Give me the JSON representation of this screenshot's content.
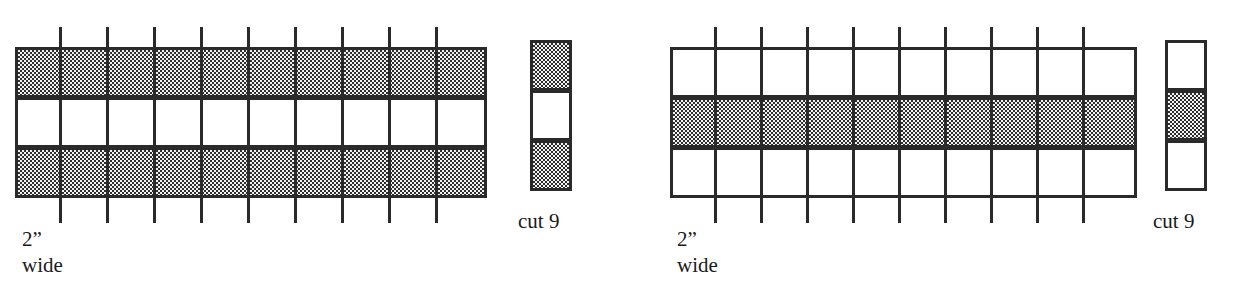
{
  "figure": {
    "kind": "quilting-strip-set-diagram",
    "ink_color": "#2a2a2a",
    "paper_color": "#ffffff",
    "fabric_dark_color": "#2e2e2e",
    "fabric_light_color": "#ffffff"
  },
  "panels": [
    {
      "id": "strip-set-a",
      "width_label": "2”",
      "width_label_line2": "wide",
      "cut_label": "cut 9",
      "segments": 10,
      "seam_count": 9,
      "bands": [
        {
          "index": 0,
          "fabric": "dark",
          "fill": "hatch"
        },
        {
          "index": 1,
          "fabric": "light",
          "fill": "plain"
        },
        {
          "index": 2,
          "fabric": "dark",
          "fill": "hatch"
        }
      ],
      "cut_unit": [
        {
          "index": 0,
          "fabric": "dark",
          "fill": "hatch"
        },
        {
          "index": 1,
          "fabric": "light",
          "fill": "plain"
        },
        {
          "index": 2,
          "fabric": "dark",
          "fill": "hatch"
        }
      ]
    },
    {
      "id": "strip-set-b",
      "width_label": "2”",
      "width_label_line2": "wide",
      "cut_label": "cut 9",
      "segments": 10,
      "seam_count": 9,
      "bands": [
        {
          "index": 0,
          "fabric": "light",
          "fill": "plain"
        },
        {
          "index": 1,
          "fabric": "dark",
          "fill": "hatch"
        },
        {
          "index": 2,
          "fabric": "light",
          "fill": "plain"
        }
      ],
      "cut_unit": [
        {
          "index": 0,
          "fabric": "light",
          "fill": "plain"
        },
        {
          "index": 1,
          "fabric": "dark",
          "fill": "hatch"
        },
        {
          "index": 2,
          "fabric": "light",
          "fill": "plain"
        }
      ]
    }
  ]
}
